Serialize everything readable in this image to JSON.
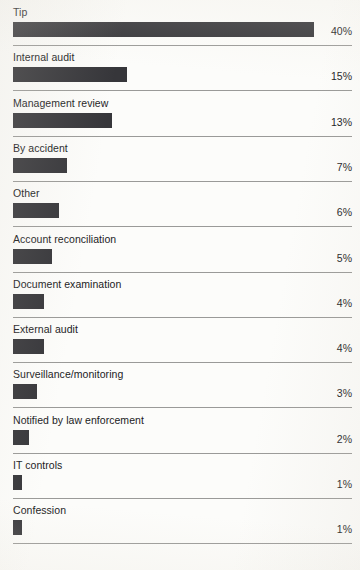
{
  "chart_data": {
    "type": "bar",
    "orientation": "horizontal",
    "title": "",
    "subtitle": "",
    "xlabel": "",
    "ylabel": "",
    "grid": false,
    "legend": false,
    "value_suffix": "%",
    "xlim": [
      0,
      40
    ],
    "categories": [
      "Tip",
      "Internal audit",
      "Management review",
      "By accident",
      "Other",
      "Account reconciliation",
      "Document examination",
      "External audit",
      "Surveillance/monitoring",
      "Notified by law enforcement",
      "IT controls",
      "Confession"
    ],
    "values": [
      40,
      15,
      13,
      7,
      6,
      5,
      4,
      4,
      3,
      2,
      1,
      1
    ],
    "tick_labels": [
      "40%",
      "15%",
      "13%",
      "7%",
      "6%",
      "5%",
      "4%",
      "4%",
      "3%",
      "2%",
      "1%",
      "1%"
    ],
    "bar_color": "#36363a",
    "background_color": "#fcfcfa",
    "rule_color": "#9a9a98",
    "text_color": "#1b1b1d"
  },
  "rows": [
    {
      "label": "Tip",
      "value": "40%",
      "pct": 40
    },
    {
      "label": "Internal audit",
      "value": "15%",
      "pct": 15
    },
    {
      "label": "Management review",
      "value": "13%",
      "pct": 13
    },
    {
      "label": "By accident",
      "value": "7%",
      "pct": 7
    },
    {
      "label": "Other",
      "value": "6%",
      "pct": 6
    },
    {
      "label": "Account reconciliation",
      "value": "5%",
      "pct": 5
    },
    {
      "label": "Document examination",
      "value": "4%",
      "pct": 4
    },
    {
      "label": "External audit",
      "value": "4%",
      "pct": 4
    },
    {
      "label": "Surveillance/monitoring",
      "value": "3%",
      "pct": 3
    },
    {
      "label": "Notified by law enforcement",
      "value": "2%",
      "pct": 2
    },
    {
      "label": "IT controls",
      "value": "1%",
      "pct": 1
    },
    {
      "label": "Confession",
      "value": "1%",
      "pct": 1
    }
  ]
}
